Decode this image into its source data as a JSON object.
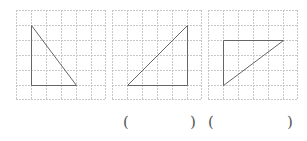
{
  "exercise": {
    "grids": [
      {
        "id": "grid-1",
        "cols": 6,
        "rows": 6,
        "triangle": [
          [
            1,
            1
          ],
          [
            1,
            5
          ],
          [
            4,
            5
          ]
        ]
      },
      {
        "id": "grid-2",
        "cols": 6,
        "rows": 6,
        "triangle": [
          [
            1,
            5
          ],
          [
            5,
            1
          ],
          [
            5,
            5
          ]
        ]
      },
      {
        "id": "grid-3",
        "cols": 6,
        "rows": 6,
        "triangle": [
          [
            1,
            2
          ],
          [
            5,
            2
          ],
          [
            1,
            5
          ]
        ]
      }
    ],
    "answers": [
      {
        "open": "(",
        "close": ")",
        "value": ""
      },
      {
        "open": "(",
        "close": ")",
        "value": ""
      }
    ],
    "colors": {
      "grid_line": "#c8c8c8",
      "shape_line": "#666666"
    }
  }
}
